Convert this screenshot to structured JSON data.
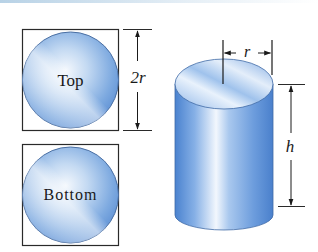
{
  "diagram": {
    "top_face": {
      "label": "Top",
      "dimension_label": "2r"
    },
    "bottom_face": {
      "label": "Bottom"
    },
    "cylinder": {
      "radius_label": "r",
      "height_label": "h"
    },
    "colors": {
      "fill_light": "#e8f1fb",
      "fill_mid": "#9cc1ea",
      "fill_dark": "#4f86cf",
      "outline": "#2a2a2a"
    }
  }
}
